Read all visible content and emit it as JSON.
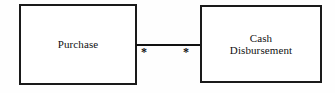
{
  "diagram": {
    "type": "uml-class-association",
    "background_color": "#fefefe",
    "line_color": "#111111",
    "entities": [
      {
        "id": "purchase",
        "label": "Purchase",
        "x": 19,
        "y": 4,
        "width": 118,
        "height": 81
      },
      {
        "id": "cash-disbursement",
        "label": "Cash\nDisbursement",
        "x": 200,
        "y": 5,
        "width": 122,
        "height": 78
      }
    ],
    "association": {
      "from": "purchase",
      "to": "cash-disbursement",
      "multiplicity_source": "*",
      "multiplicity_target": "*"
    }
  }
}
